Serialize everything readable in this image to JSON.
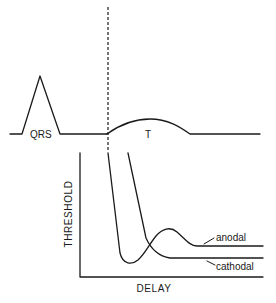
{
  "figure": {
    "ecg": {
      "qrs_label": "QRS",
      "t_label": "T"
    },
    "plot": {
      "y_axis_label": "THRESHOLD",
      "x_axis_label": "DELAY",
      "curves": [
        {
          "name": "anodal",
          "label": "anodal"
        },
        {
          "name": "cathodal",
          "label": "cathodal"
        }
      ]
    },
    "colors": {
      "ink": "#1a1a1a",
      "background": "#ffffff"
    }
  }
}
